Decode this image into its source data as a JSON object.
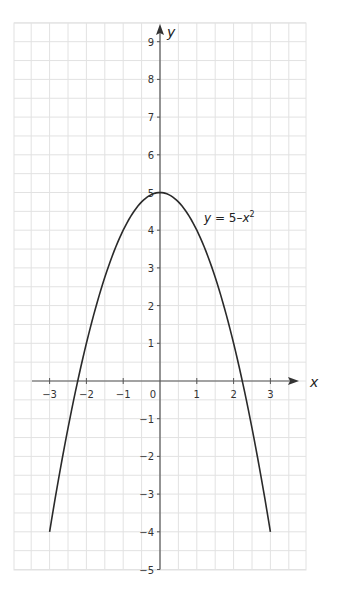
{
  "chart_data": {
    "type": "line",
    "title": "",
    "xlabel": "x",
    "ylabel": "y",
    "xlim": [
      -3.5,
      4
    ],
    "ylim": [
      -5,
      9
    ],
    "grid": true,
    "x_ticks": [
      "-3",
      "-2",
      "-1",
      "0",
      "1",
      "2",
      "3"
    ],
    "y_ticks": [
      "9",
      "8",
      "7",
      "6",
      "5",
      "4",
      "3",
      "2",
      "1",
      "-1",
      "-2",
      "-3",
      "-4",
      "-5"
    ],
    "annotation": "y = 5–x²",
    "series": [
      {
        "name": "y = 5-x^2",
        "x": [
          -3,
          -2.5,
          -2,
          -1.5,
          -1,
          -0.5,
          0,
          0.5,
          1,
          1.5,
          2,
          2.5,
          3
        ],
        "y": [
          -4,
          -1.25,
          1,
          2.75,
          4,
          4.75,
          5,
          4.75,
          4,
          2.75,
          1,
          -1.25,
          -4
        ]
      }
    ]
  },
  "labels": {
    "x_axis": "x",
    "y_axis": "y",
    "equation_y": "y",
    "equation_rest": " = 5–",
    "equation_x": "x",
    "equation_exp": "2"
  },
  "colors": {
    "grid": "#e2e2e2",
    "axis": "#555555",
    "curve": "#2a2a2a"
  }
}
